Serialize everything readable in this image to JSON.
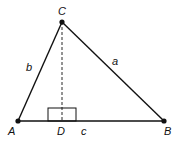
{
  "diagram": {
    "vertices": {
      "A": {
        "label": "A",
        "x": 18,
        "y": 121
      },
      "B": {
        "label": "B",
        "x": 164,
        "y": 121
      },
      "C": {
        "label": "C",
        "x": 62,
        "y": 22
      },
      "D": {
        "label": "D",
        "x": 62,
        "y": 121
      }
    },
    "sides": {
      "a": {
        "label": "a",
        "from": "C",
        "to": "B"
      },
      "b": {
        "label": "b",
        "from": "A",
        "to": "C"
      },
      "c": {
        "label": "c",
        "from": "A",
        "to": "B"
      }
    },
    "altitude": {
      "from": "C",
      "to": "D",
      "style": "dashed"
    },
    "right_angle_marker": {
      "at": "D"
    },
    "colors": {
      "stroke": "#111111",
      "background": "#ffffff"
    }
  }
}
